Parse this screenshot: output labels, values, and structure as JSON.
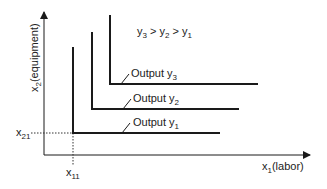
{
  "diagram": {
    "type": "isoquants-fixed-proportions",
    "relation_label": {
      "base": "y",
      "parts": [
        {
          "main": "y",
          "sub": "3"
        },
        {
          "main": "y",
          "sub": "2"
        },
        {
          "main": "y",
          "sub": "1"
        }
      ],
      "separator": " > "
    },
    "axes": {
      "x": {
        "main": "x",
        "sub": "1",
        "suffix": "(labor)"
      },
      "y": {
        "main": "x",
        "sub": "2",
        "suffix": "(equipment)"
      }
    },
    "ticks": {
      "x11": {
        "main": "x",
        "sub": "11"
      },
      "x21": {
        "main": "x",
        "sub": "21"
      }
    },
    "isoquants": [
      {
        "label": "Output",
        "var": "y",
        "sub": "1",
        "corner": [
          73,
          133
        ],
        "top": 47,
        "right": 220
      },
      {
        "label": "Output",
        "var": "y",
        "sub": "2",
        "corner": [
          92,
          109
        ],
        "top": 32,
        "right": 239
      },
      {
        "label": "Output",
        "var": "y",
        "sub": "3",
        "corner": [
          110,
          84
        ],
        "top": 15,
        "right": 258
      }
    ],
    "colors": {
      "line": "#1a1a1a",
      "text": "#222222",
      "background": "#ffffff"
    }
  }
}
